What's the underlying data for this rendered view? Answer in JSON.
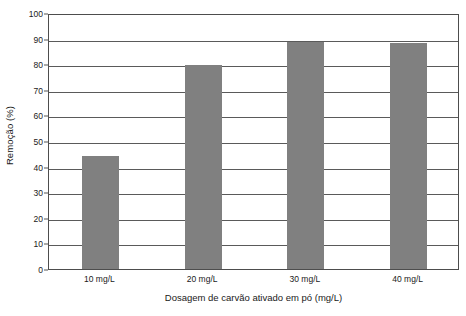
{
  "chart_data": {
    "type": "bar",
    "title": "",
    "xlabel": "Dosagem de carvão ativado em pó (mg/L)",
    "ylabel": "Remoção (%)",
    "categories": [
      "10 mg/L",
      "20 mg/L",
      "30 mg/L",
      "40 mg/L"
    ],
    "values": [
      44.2,
      79.8,
      88.8,
      88.3
    ],
    "ylim": [
      0,
      100
    ],
    "ytick_step": 10,
    "yticks": [
      0,
      10,
      20,
      30,
      40,
      50,
      60,
      70,
      80,
      90,
      100
    ],
    "ytick_labels": [
      "0",
      "10",
      "20",
      "30",
      "40",
      "50",
      "60",
      "70",
      "80",
      "90",
      "100"
    ],
    "grid": true,
    "grid_axis": "y",
    "legend": false,
    "legend_position": "none",
    "bar_color": "#808080",
    "axis_color": "#4d4d4d",
    "grid_color": "#5a5a5a",
    "background_color": "#ffffff",
    "bar_width_ratio": 0.36
  }
}
